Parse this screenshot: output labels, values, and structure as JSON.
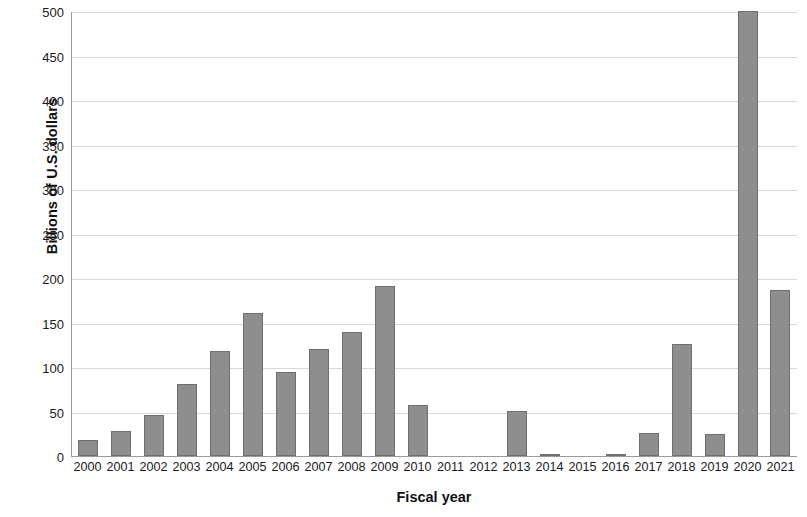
{
  "chart_data": {
    "type": "bar",
    "title": "",
    "xlabel": "Fiscal year",
    "ylabel": "Billions of U.S. dollars",
    "categories": [
      "2000",
      "2001",
      "2002",
      "2003",
      "2004",
      "2005",
      "2006",
      "2007",
      "2008",
      "2009",
      "2010",
      "2011",
      "2012",
      "2013",
      "2014",
      "2015",
      "2016",
      "2017",
      "2018",
      "2019",
      "2020",
      "2021"
    ],
    "values": [
      18,
      28,
      46,
      81,
      118,
      161,
      94,
      120,
      139,
      191,
      57,
      0,
      0,
      51,
      1,
      0,
      1,
      26,
      126,
      25,
      500,
      187
    ],
    "ylim": [
      0,
      500
    ],
    "ytick_labels": [
      "500",
      "450",
      "400",
      "350",
      "300",
      "250",
      "200",
      "150",
      "100",
      "50",
      "0"
    ],
    "ytick_values": [
      500,
      450,
      400,
      350,
      300,
      250,
      200,
      150,
      100,
      50,
      0
    ],
    "ytick_step": 50,
    "grid": true,
    "legend": null,
    "bar_color": "#8e8e8e",
    "bar_border_color": "#6f6f6f",
    "gridline_color": "#d9d9d9",
    "axis_color": "#9a9a9a"
  }
}
